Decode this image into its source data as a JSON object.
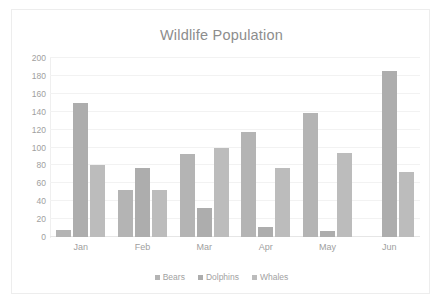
{
  "chart_data": {
    "type": "bar",
    "title": "Wildlife Population",
    "xlabel": "",
    "ylabel": "",
    "categories": [
      "Jan",
      "Feb",
      "Mar",
      "Apr",
      "May",
      "Jun"
    ],
    "series": [
      {
        "name": "Bears",
        "values": [
          8,
          53,
          93,
          117,
          139,
          0
        ]
      },
      {
        "name": "Dolphins",
        "values": [
          150,
          77,
          32,
          11,
          7,
          185
        ]
      },
      {
        "name": "Whales",
        "values": [
          80,
          53,
          100,
          77,
          94,
          73
        ]
      }
    ],
    "ylim": [
      0,
      200
    ],
    "yticks": [
      0,
      20,
      40,
      60,
      80,
      100,
      120,
      140,
      160,
      180,
      200
    ],
    "ytick_labels": [
      "0",
      "20",
      "40",
      "60",
      "80",
      "100",
      "120",
      "140",
      "160",
      "180",
      "200"
    ],
    "grid": true,
    "legend_position": "bottom",
    "colors": {
      "bears": "#b4b4b4",
      "dolphins": "#adadad",
      "whales": "#bcbcbc",
      "title_text": "#8d8d8d",
      "tick_text": "#a0a0a0",
      "gridline": "#f2f2f2",
      "frame_border": "#ededed",
      "background": "#ffffff"
    }
  }
}
